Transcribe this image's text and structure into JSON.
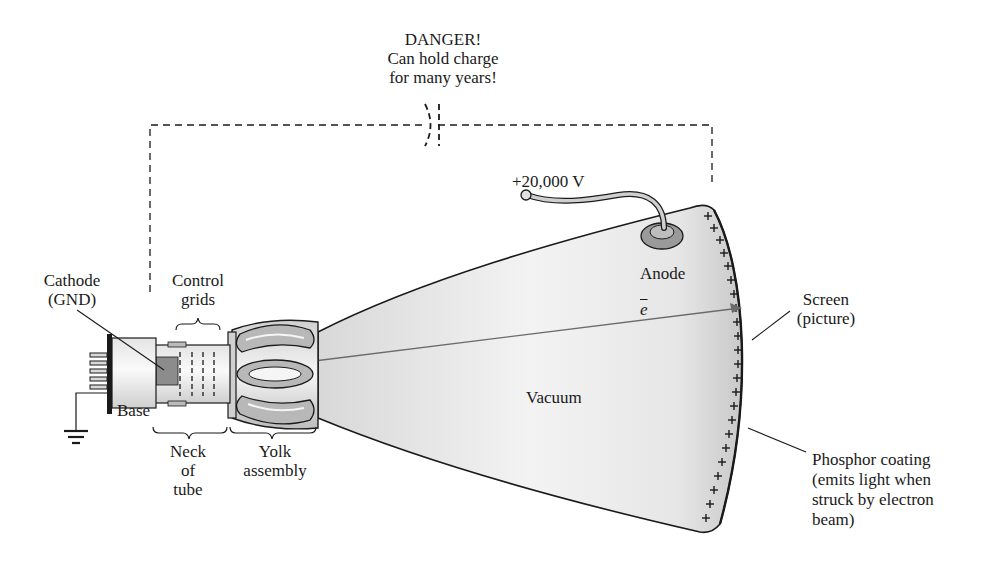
{
  "diagram": {
    "type": "cathode-ray tube cross-section",
    "warning": {
      "line1": "DANGER!",
      "line2": "Can hold charge",
      "line3": "for many years!"
    },
    "labels": {
      "cathode_line1": "Cathode",
      "cathode_line2": "(GND)",
      "control_line1": "Control",
      "control_line2": "grids",
      "base": "Base",
      "neck_line1": "Neck",
      "neck_line2": "of",
      "neck_line3": "tube",
      "yolk_line1": "Yolk",
      "yolk_line2": "assembly",
      "voltage": "+20,000 V",
      "anode": "Anode",
      "electron": "e",
      "vacuum": "Vacuum",
      "screen_line1": "Screen",
      "screen_line2": "(picture)",
      "phosphor_line1": "Phosphor coating",
      "phosphor_line2": "(emits light when",
      "phosphor_line3": "struck by electron",
      "phosphor_line4": "beam)"
    },
    "colors": {
      "line": "#1a1a1a",
      "tube_fill_light": "#f2f2f2",
      "tube_fill_dark": "#c8c8c8",
      "cathode_block": "#8c8c8c",
      "beam": "#6a6a6a"
    }
  }
}
